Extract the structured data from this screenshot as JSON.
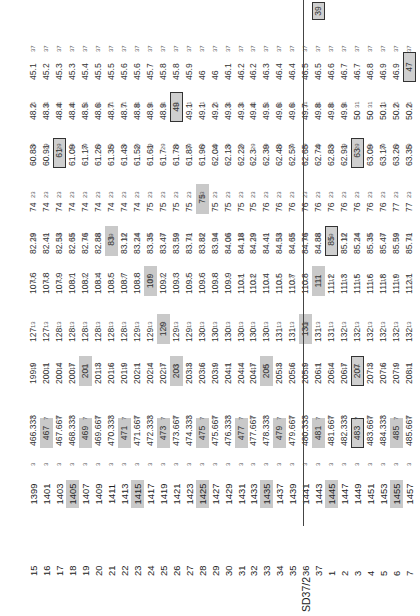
{
  "section_label": "SD37/2",
  "row_meta": [
    {
      "num": "15",
      "id": "1399",
      "v": [
        "466.333",
        "199.9",
        "127",
        "107.6",
        "82.29",
        "74",
        "60.83",
        "48.2",
        "45.1"
      ]
    },
    {
      "num": "16",
      "id": "1401",
      "v": [
        "467",
        "200.1",
        "127",
        "107.8",
        "82.41",
        "74",
        "60.91",
        "48.3",
        "45.2"
      ]
    },
    {
      "num": "17",
      "id": "1403",
      "v": [
        "467.667",
        "200.4",
        "128",
        "107.9",
        "82.53",
        "74",
        "61",
        "48.4",
        "45.3"
      ]
    },
    {
      "num": "18",
      "id": "1405",
      "v": [
        "468.333",
        "200.7",
        "128",
        "108.1",
        "82.65",
        "74",
        "61.09",
        "48.4",
        "45.3"
      ]
    },
    {
      "num": "19",
      "id": "1407",
      "v": [
        "469",
        "201",
        "128",
        "108.2",
        "82.76",
        "74",
        "61.17",
        "48.5",
        "45.4"
      ]
    },
    {
      "num": "20",
      "id": "1409",
      "v": [
        "469.667",
        "201.3",
        "128",
        "108.4",
        "82.88",
        "74",
        "61.26",
        "48.6",
        "45.5"
      ]
    },
    {
      "num": "21",
      "id": "1411",
      "v": [
        "470.333",
        "201.6",
        "128",
        "108.5",
        "83",
        "74",
        "61.35",
        "48.7",
        "45.5"
      ]
    },
    {
      "num": "22",
      "id": "1413",
      "v": [
        "471",
        "201.9",
        "128",
        "108.7",
        "83.12",
        "74",
        "61.43",
        "48.7",
        "45.6"
      ]
    },
    {
      "num": "23",
      "id": "1415",
      "v": [
        "471.667",
        "202.1",
        "129",
        "108.8",
        "83.24",
        "74",
        "61.52",
        "48.8",
        "45.6"
      ]
    },
    {
      "num": "24",
      "id": "1417",
      "v": [
        "472.333",
        "202.4",
        "129",
        "109",
        "83.35",
        "75",
        "61.61",
        "48.9",
        "45.7"
      ]
    },
    {
      "num": "25",
      "id": "1419",
      "v": [
        "473",
        "202.7",
        "129",
        "109.2",
        "83.47",
        "75",
        "61.7",
        "48.9",
        "45.8"
      ]
    },
    {
      "num": "26",
      "id": "1421",
      "v": [
        "473.667",
        "203",
        "129",
        "109.3",
        "83.59",
        "75",
        "61.78",
        "49",
        "45.8"
      ]
    },
    {
      "num": "27",
      "id": "1423",
      "v": [
        "474.333",
        "203.3",
        "129",
        "109.5",
        "83.71",
        "75",
        "61.87",
        "49.1",
        "45.9"
      ]
    },
    {
      "num": "28",
      "id": "1425",
      "v": [
        "475",
        "203.6",
        "130",
        "109.6",
        "83.82",
        "75",
        "61.96",
        "49.1",
        "46"
      ]
    },
    {
      "num": "29",
      "id": "1427",
      "v": [
        "475.667",
        "203.9",
        "130",
        "109.8",
        "83.94",
        "75",
        "62.04",
        "49.2",
        "46"
      ]
    },
    {
      "num": "30",
      "id": "1429",
      "v": [
        "476.333",
        "204.1",
        "130",
        "109.9",
        "84.06",
        "75",
        "62.13",
        "49.3",
        "46.1"
      ]
    },
    {
      "num": "31",
      "id": "1431",
      "v": [
        "477",
        "204.4",
        "130",
        "110.1",
        "84.18",
        "75",
        "62.22",
        "49.3",
        "46.2"
      ]
    },
    {
      "num": "32",
      "id": "1433",
      "v": [
        "477.667",
        "204.7",
        "130",
        "110.2",
        "84.29",
        "75",
        "62.3",
        "49.4",
        "46.2"
      ]
    },
    {
      "num": "33",
      "id": "1435",
      "v": [
        "478.333",
        "205",
        "130",
        "110.4",
        "84.41",
        "76",
        "62.39",
        "49.5",
        "46.3"
      ]
    },
    {
      "num": "34",
      "id": "1437",
      "v": [
        "479",
        "205.3",
        "131",
        "110.5",
        "84.53",
        "76",
        "62.48",
        "49.6",
        "46.4"
      ]
    },
    {
      "num": "35",
      "id": "1439",
      "v": [
        "479.667",
        "205.6",
        "131",
        "110.7",
        "84.65",
        "76",
        "62.57",
        "49.6",
        "46.4"
      ]
    },
    {
      "num": "36",
      "id": "1441",
      "v": [
        "480.333",
        "205.9",
        "131",
        "110.8",
        "84.76",
        "76",
        "62.65",
        "49.7",
        "46.5"
      ]
    },
    {
      "num": "37",
      "id": "1443",
      "v": [
        "481",
        "206.1",
        "131",
        "111",
        "84.88",
        "76",
        "62.74",
        "49.8",
        "46.5"
      ]
    },
    {
      "num": "1",
      "id": "1445",
      "v": [
        "481.667",
        "206.4",
        "131",
        "111.2",
        "85",
        "76",
        "62.83",
        "49.8",
        "46.6"
      ]
    },
    {
      "num": "2",
      "id": "1447",
      "v": [
        "482.333",
        "206.7",
        "132",
        "111.3",
        "85.12",
        "76",
        "62.91",
        "49.9",
        "46.7"
      ]
    },
    {
      "num": "3",
      "id": "1449",
      "v": [
        "483",
        "207",
        "132",
        "111.5",
        "85.24",
        "76",
        "63",
        "50",
        "46.7"
      ]
    },
    {
      "num": "4",
      "id": "1451",
      "v": [
        "483.667",
        "207.3",
        "132",
        "111.6",
        "85.35",
        "76",
        "63.09",
        "50",
        "46.8"
      ]
    },
    {
      "num": "5",
      "id": "1453",
      "v": [
        "484.333",
        "207.6",
        "132",
        "111.8",
        "85.47",
        "76",
        "63.17",
        "50.1",
        "46.9"
      ]
    },
    {
      "num": "6",
      "id": "1455",
      "v": [
        "485",
        "207.9",
        "132",
        "111.9",
        "85.59",
        "77",
        "63.26",
        "50.2",
        "46.9"
      ]
    },
    {
      "num": "7",
      "id": "1457",
      "v": [
        "485.667",
        "208.1",
        "132",
        "112.1",
        "85.71",
        "77",
        "63.35",
        "50.2",
        "47"
      ]
    }
  ],
  "divisors": [
    "3",
    "7",
    "11",
    "13",
    "17",
    "19",
    "23",
    "29",
    "31",
    "37"
  ],
  "extra_boxed_value": "39"
}
